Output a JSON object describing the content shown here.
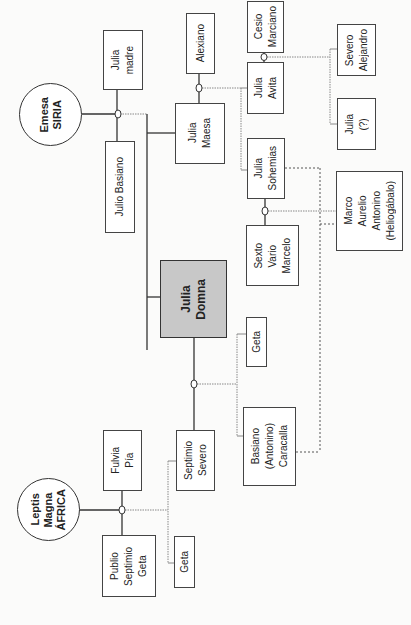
{
  "diagram": {
    "places": [
      {
        "id": "emesa",
        "label": "Emesa\nSIRIA"
      },
      {
        "id": "leptis",
        "label": "Leptis\nMagna\nÁFRICA"
      }
    ],
    "people": [
      {
        "id": "julia_madre",
        "label": "Julia\nmadre"
      },
      {
        "id": "julio_basiano",
        "label": "Julio Basiano"
      },
      {
        "id": "alexiano",
        "label": "Alexiano"
      },
      {
        "id": "julia_maesa",
        "label": "Julia\nMaesa"
      },
      {
        "id": "cesio_marciano",
        "label": "Cesio\nMarciano"
      },
      {
        "id": "julia_avita",
        "label": "Julia\nAvita"
      },
      {
        "id": "severo_alejandro",
        "label": "Severo\nAlejandro"
      },
      {
        "id": "julia_q",
        "label": "Julia\n(?)"
      },
      {
        "id": "julia_sohemias",
        "label": "Julia\nSohemias"
      },
      {
        "id": "sexto_vario_marcelo",
        "label": "Sexto\nVario\nMarcelo"
      },
      {
        "id": "heliogabalo",
        "label": "Marco\nAurelio\nAntonino\n(Heliogábalo)"
      },
      {
        "id": "julia_domna",
        "label": "Julia\nDomna"
      },
      {
        "id": "geta_hijo",
        "label": "Geta"
      },
      {
        "id": "caracalla",
        "label": "Basiano\n(Antonino)\nCaracalla"
      },
      {
        "id": "septimio_severo",
        "label": "Septimio\nSevero"
      },
      {
        "id": "fulvia_pia",
        "label": "Fulvia\nPía"
      },
      {
        "id": "publio_septimio_geta",
        "label": "Publio\nSeptimio\nGeta"
      },
      {
        "id": "geta_hermano",
        "label": "Geta"
      }
    ],
    "colors": {
      "line": "#333333",
      "dotted": "#777777",
      "highlight": "#c8c8c8"
    }
  }
}
